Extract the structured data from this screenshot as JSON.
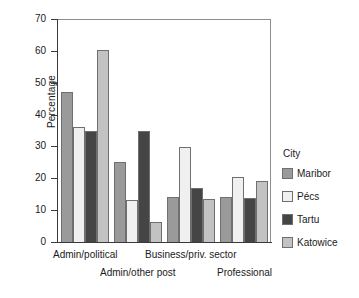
{
  "chart_data": {
    "type": "bar",
    "title": "",
    "xlabel": "",
    "ylabel": "Percentage",
    "ylim": [
      0,
      70
    ],
    "yticks": [
      0,
      10,
      20,
      30,
      40,
      50,
      60,
      70
    ],
    "grid": false,
    "legend_position": "right",
    "legend_title": "City",
    "categories": [
      "Admin/political",
      "Admin/other post",
      "Business/priv. sector",
      "Professional"
    ],
    "series": [
      {
        "name": "Maribor",
        "color": "#9a9a9a",
        "values": [
          47.0,
          25.0,
          14.0,
          14.0
        ]
      },
      {
        "name": "Pécs",
        "color": "#f0f0f0",
        "values": [
          36.2,
          13.2,
          29.8,
          20.5
        ]
      },
      {
        "name": "Tartu",
        "color": "#454545",
        "values": [
          34.8,
          34.7,
          17.0,
          13.9
        ]
      },
      {
        "name": "Katowice",
        "color": "#c2c2c2",
        "values": [
          60.4,
          6.3,
          13.6,
          19.3
        ]
      }
    ]
  },
  "axis": {
    "y_title": "Percentage",
    "y_tick_labels": [
      "0",
      "10",
      "20",
      "30",
      "40",
      "50",
      "60",
      "70"
    ],
    "x_tick_labels": [
      "Admin/political",
      "Admin/other post",
      "Business/priv. sector",
      "Professional"
    ]
  },
  "legend": {
    "title": "City",
    "items": [
      {
        "label": "Maribor"
      },
      {
        "label": "Pécs"
      },
      {
        "label": "Tartu"
      },
      {
        "label": "Katowice"
      }
    ]
  }
}
